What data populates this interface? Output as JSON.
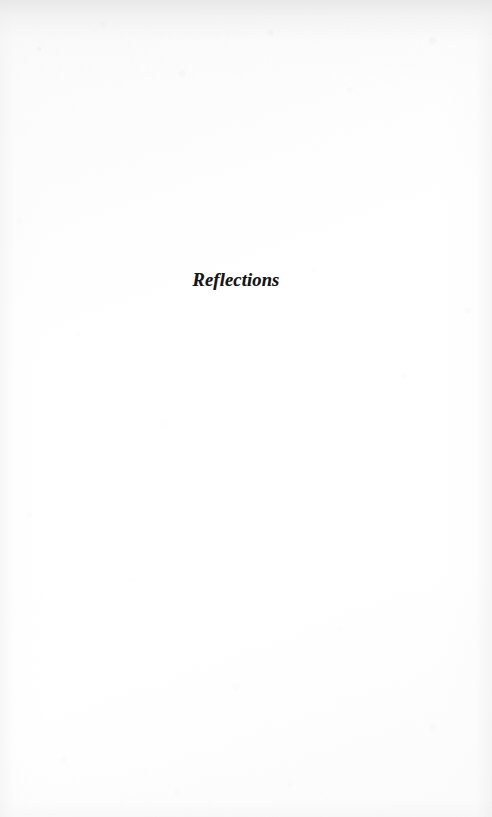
{
  "page": {
    "kind": "scanned-book-section-divider",
    "width": 492,
    "height": 817,
    "paper_color": "#fdfdfd",
    "ink_color": "#151515",
    "top_edge_shade": "#e7e7e8"
  },
  "content": {
    "section_title": "Reflections"
  }
}
